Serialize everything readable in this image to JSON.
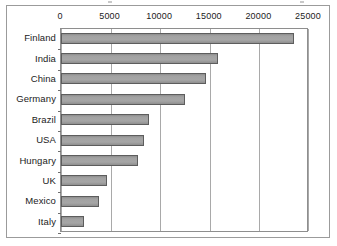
{
  "figure": {
    "frame": true,
    "background_color": "#ffffff",
    "bar_fill_color": "#9c9c9c",
    "bar_border_color": "#5d5d5d",
    "grid_color": "#a9a9a9",
    "axis_color": "#8e8e8e",
    "text_color": "#1b1b1b"
  },
  "chart_data": {
    "type": "bar",
    "orientation": "horizontal",
    "title": "",
    "subtitle": "",
    "xlabel": "",
    "ylabel": "",
    "categories": [
      "Finland",
      "India",
      "China",
      "Germany",
      "Brazil",
      "USA",
      "Hungary",
      "UK",
      "Mexico",
      "Italy"
    ],
    "values": [
      23500,
      15800,
      14600,
      12550,
      8850,
      8350,
      7750,
      4650,
      3870,
      2350
    ],
    "xlim": [
      0,
      25000
    ],
    "xticks": [
      0,
      5000,
      10000,
      15000,
      20000,
      25000
    ],
    "xtick_labels": [
      "0",
      "5000",
      "10000",
      "15000",
      "20000",
      "25000"
    ],
    "xaxis_position": "top",
    "grid": true,
    "grid_axis": "x",
    "legend": false,
    "legend_position": "none",
    "series": [
      {
        "name": "",
        "values": [
          23500,
          15800,
          14600,
          12550,
          8850,
          8350,
          7750,
          4650,
          3870,
          2350
        ]
      }
    ]
  }
}
